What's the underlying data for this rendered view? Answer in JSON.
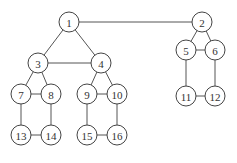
{
  "diagram": {
    "type": "undirected-graph",
    "node_radius": 10,
    "colors": {
      "background": "#ffffff",
      "stroke": "#444444",
      "text": "#333333"
    },
    "nodes": [
      {
        "id": "1",
        "label": "1",
        "x": 69,
        "y": 22
      },
      {
        "id": "2",
        "label": "2",
        "x": 202,
        "y": 22
      },
      {
        "id": "3",
        "label": "3",
        "x": 38,
        "y": 63
      },
      {
        "id": "4",
        "label": "4",
        "x": 101,
        "y": 63
      },
      {
        "id": "5",
        "label": "5",
        "x": 186,
        "y": 50
      },
      {
        "id": "6",
        "label": "6",
        "x": 215,
        "y": 50
      },
      {
        "id": "7",
        "label": "7",
        "x": 21,
        "y": 94
      },
      {
        "id": "8",
        "label": "8",
        "x": 51,
        "y": 94
      },
      {
        "id": "9",
        "label": "9",
        "x": 87,
        "y": 94
      },
      {
        "id": "10",
        "label": "10",
        "x": 117,
        "y": 94
      },
      {
        "id": "11",
        "label": "11",
        "x": 186,
        "y": 96
      },
      {
        "id": "12",
        "label": "12",
        "x": 215,
        "y": 96
      },
      {
        "id": "13",
        "label": "13",
        "x": 21,
        "y": 135
      },
      {
        "id": "14",
        "label": "14",
        "x": 51,
        "y": 135
      },
      {
        "id": "15",
        "label": "15",
        "x": 87,
        "y": 135
      },
      {
        "id": "16",
        "label": "16",
        "x": 117,
        "y": 135
      }
    ],
    "edges": [
      [
        "1",
        "2"
      ],
      [
        "1",
        "3"
      ],
      [
        "1",
        "4"
      ],
      [
        "3",
        "4"
      ],
      [
        "3",
        "7"
      ],
      [
        "3",
        "8"
      ],
      [
        "7",
        "8"
      ],
      [
        "7",
        "13"
      ],
      [
        "8",
        "14"
      ],
      [
        "13",
        "14"
      ],
      [
        "4",
        "9"
      ],
      [
        "4",
        "10"
      ],
      [
        "9",
        "10"
      ],
      [
        "9",
        "15"
      ],
      [
        "10",
        "16"
      ],
      [
        "15",
        "16"
      ],
      [
        "2",
        "5"
      ],
      [
        "2",
        "6"
      ],
      [
        "5",
        "6"
      ],
      [
        "5",
        "11"
      ],
      [
        "6",
        "12"
      ],
      [
        "11",
        "12"
      ]
    ]
  }
}
